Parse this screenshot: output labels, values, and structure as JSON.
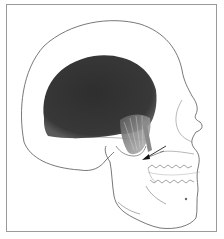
{
  "figure": {
    "regions": [
      {
        "name": "temporalis-muscle",
        "fill": "#3a3a3a"
      },
      {
        "name": "temporalis-tendon-fibers",
        "fill": "#9a9a9a"
      },
      {
        "name": "skull-outline",
        "stroke": "#555555"
      }
    ],
    "annotations": [
      {
        "type": "arrow",
        "label": "",
        "points_to": "coronoid process"
      }
    ]
  },
  "colors": {
    "background": "#ffffff",
    "frame": "#9a9a9a",
    "muscle_dark": "#333333",
    "line": "#555555"
  }
}
